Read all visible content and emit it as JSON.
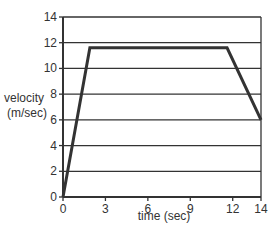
{
  "chart_data": {
    "type": "line",
    "title": "",
    "xlabel": "time (sec)",
    "ylabel": "velocity (m/sec)",
    "ylabel_lines": [
      "velocity",
      "(m/sec)"
    ],
    "xlim": [
      0,
      14
    ],
    "ylim": [
      0,
      14
    ],
    "x_ticks": [
      0,
      3,
      6,
      9,
      12,
      14
    ],
    "y_ticks": [
      0,
      2,
      4,
      6,
      8,
      10,
      12,
      14
    ],
    "grid": "horizontal",
    "legend": null,
    "series": [
      {
        "name": "velocity",
        "color": "#333333",
        "points": [
          {
            "x": 0,
            "y": 0
          },
          {
            "x": 1.9,
            "y": 11.6
          },
          {
            "x": 11.6,
            "y": 11.6
          },
          {
            "x": 14,
            "y": 6
          }
        ]
      }
    ]
  },
  "colors": {
    "line": "#333333",
    "grid": "#333333",
    "background": "#ffffff"
  }
}
